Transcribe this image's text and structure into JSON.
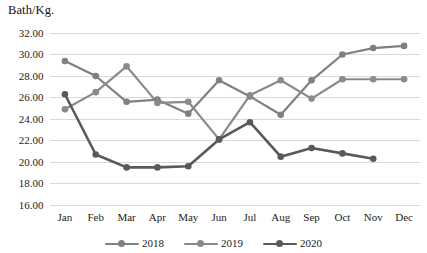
{
  "chart_data": {
    "type": "line",
    "title": "",
    "ylabel": "Bath/Kg.",
    "xlabel": "",
    "ylim": [
      16.0,
      32.0
    ],
    "ytick_step": 2.0,
    "yticks": [
      "16.00",
      "18.00",
      "20.00",
      "22.00",
      "24.00",
      "26.00",
      "28.00",
      "30.00",
      "32.00"
    ],
    "grid": true,
    "legend_position": "bottom",
    "categories": [
      "Jan",
      "Feb",
      "Mar",
      "Apr",
      "May",
      "Jun",
      "Jul",
      "Aug",
      "Sep",
      "Oct",
      "Nov",
      "Dec"
    ],
    "series": [
      {
        "name": "2018",
        "color": "#808080",
        "values": [
          29.4,
          28.0,
          25.6,
          25.8,
          24.5,
          27.6,
          26.1,
          24.4,
          27.6,
          30.0,
          30.6,
          30.8
        ]
      },
      {
        "name": "2019",
        "color": "#8a8a8a",
        "values": [
          24.9,
          26.5,
          28.9,
          25.5,
          25.6,
          22.1,
          26.2,
          27.6,
          25.9,
          27.7,
          27.7,
          27.7
        ]
      },
      {
        "name": "2020",
        "color": "#595959",
        "values": [
          26.3,
          20.7,
          19.5,
          19.5,
          19.6,
          22.1,
          23.7,
          20.5,
          21.3,
          20.8,
          20.3,
          null
        ]
      }
    ]
  },
  "colors": {
    "gridline": "#d9d9d9",
    "text": "#1b1b1b",
    "background": "#ffffff"
  }
}
